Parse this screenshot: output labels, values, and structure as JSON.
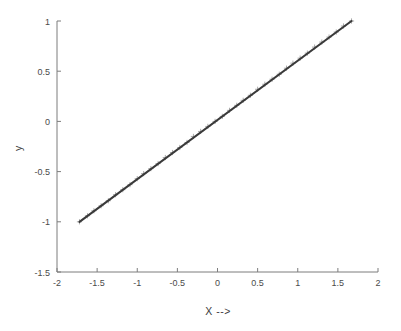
{
  "chart_data": {
    "type": "line",
    "title": "",
    "subtitle": "",
    "xlabel": "X -->",
    "ylabel": "y",
    "xlim": [
      -2,
      2
    ],
    "ylim": [
      -1.5,
      1
    ],
    "grid": false,
    "legend": null,
    "xticks": [
      -2,
      -1.5,
      -1,
      -0.5,
      0,
      0.5,
      1,
      1.5,
      2
    ],
    "xticklabels": [
      "-2",
      "-1.5",
      "-1",
      "-0.5",
      "0",
      "0.5",
      "1",
      "1.5",
      "2"
    ],
    "yticks": [
      -1.5,
      -1,
      -0.5,
      0,
      0.5,
      1
    ],
    "yticklabels": [
      "-1.5",
      "-1",
      "-0.5",
      "0",
      "0.5",
      "1"
    ],
    "series": [
      {
        "name": "fit-line",
        "style": "solid-line",
        "color": "#3a3a3a",
        "x": [
          -1.72,
          1.67
        ],
        "values": [
          -1.0,
          1.0
        ]
      },
      {
        "name": "data-points",
        "style": "plus-markers",
        "color": "#9a9a9a",
        "x": [
          -1.72,
          -1.62,
          -1.54,
          -1.45,
          -1.36,
          -1.27,
          -1.18,
          -1.09,
          -1.0,
          -0.92,
          -0.83,
          -0.74,
          -0.65,
          -0.56,
          -0.47,
          -0.38,
          -0.3,
          -0.21,
          -0.12,
          -0.03,
          0.06,
          0.15,
          0.24,
          0.32,
          0.41,
          0.5,
          0.59,
          0.68,
          0.77,
          0.86,
          0.94,
          1.03,
          1.12,
          1.21,
          1.3,
          1.39,
          1.48,
          1.57,
          1.67
        ],
        "values": [
          -1.0,
          -0.94,
          -0.89,
          -0.84,
          -0.79,
          -0.73,
          -0.68,
          -0.63,
          -0.57,
          -0.52,
          -0.47,
          -0.42,
          -0.36,
          -0.31,
          -0.26,
          -0.21,
          -0.15,
          -0.1,
          -0.05,
          0.0,
          0.05,
          0.11,
          0.16,
          0.21,
          0.26,
          0.32,
          0.37,
          0.42,
          0.47,
          0.53,
          0.58,
          0.63,
          0.68,
          0.74,
          0.79,
          0.84,
          0.89,
          0.95,
          1.0
        ]
      }
    ]
  },
  "axes": {
    "x_label": "X -->",
    "y_label": "y"
  },
  "colors": {
    "line": "#3a3a3a",
    "marker": "#9a9a9a",
    "axis": "#7d7d7d",
    "text": "#4a4a4a",
    "background": "#ffffff"
  }
}
